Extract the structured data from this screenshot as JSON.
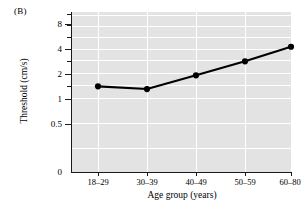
{
  "panel": {
    "label": "(B)"
  },
  "chart_data": {
    "type": "line",
    "title": "",
    "subtitle": "",
    "xlabel": "Age group (years)",
    "ylabel": "Threshold (cm/s)",
    "categories": [
      "18–29",
      "30–39",
      "40–49",
      "50–59",
      "60–80"
    ],
    "values": [
      1.4,
      1.3,
      1.9,
      2.8,
      4.2
    ],
    "series": [
      {
        "name": "Threshold",
        "values": [
          1.4,
          1.3,
          1.9,
          2.8,
          4.2
        ]
      }
    ],
    "yscale": "log",
    "ylim": [
      0.28,
      10.0
    ],
    "ytick_labels": [
      "0",
      "0.5",
      "1",
      "2",
      "4",
      "8"
    ],
    "ytick_values": [
      0,
      0.5,
      1,
      2,
      4,
      8
    ],
    "yaxis_break_at_zero": true,
    "grid": true,
    "grid_color": "#ffffff",
    "plot_background": "#e3e3e3",
    "line_color": "#000000",
    "marker": "filled-circle",
    "marker_color": "#000000",
    "legend": null,
    "legend_position": "none",
    "annotations": []
  }
}
